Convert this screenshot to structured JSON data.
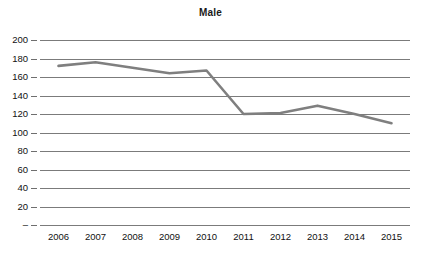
{
  "chart_data": {
    "type": "line",
    "title": "Male",
    "xlabel": "",
    "ylabel": "",
    "categories": [
      "2006",
      "2007",
      "2008",
      "2009",
      "2010",
      "2011",
      "2012",
      "2013",
      "2014",
      "2015"
    ],
    "values": [
      172,
      176,
      170,
      164,
      167,
      120,
      121,
      129,
      120,
      110
    ],
    "series": [
      {
        "name": "Male",
        "values": [
          172,
          176,
          170,
          164,
          167,
          120,
          121,
          129,
          120,
          110
        ]
      }
    ],
    "ylim": [
      0,
      200
    ],
    "ytick_values": [
      0,
      20,
      40,
      60,
      80,
      100,
      120,
      140,
      160,
      180,
      200
    ],
    "ytick_labels": [
      "–",
      "20",
      "40",
      "60",
      "80",
      "100",
      "120",
      "140",
      "160",
      "180",
      "200"
    ],
    "grid": true,
    "legend": "none",
    "line_color": "#7f7f7f",
    "gridline_color": "#7b7b7b",
    "text_color": "#111111",
    "background_color": "#ffffff"
  }
}
